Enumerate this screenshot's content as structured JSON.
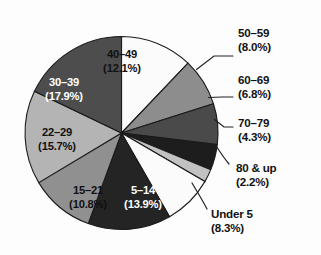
{
  "chart_data": {
    "type": "pie",
    "title": "",
    "subtitle": "",
    "xlabel": "",
    "ylabel": "",
    "legend_position": "none",
    "grid": false,
    "start_angle_deg": 0,
    "direction": "clockwise",
    "units": "percent",
    "categories": [
      "40–49",
      "50–59",
      "60–69",
      "70–79",
      "80 & up",
      "Under 5",
      "5–14",
      "15–21",
      "22–29",
      "30–39"
    ],
    "values": [
      12.1,
      8.0,
      6.8,
      4.3,
      2.2,
      8.3,
      13.9,
      10.8,
      15.7,
      17.9
    ],
    "slices": [
      {
        "category": "40–49",
        "value": 12.1,
        "label_name": "40–49",
        "label_pct": "(12.1%)",
        "color": "#fbfbfb",
        "label_placement": "inside",
        "text_color": "dark"
      },
      {
        "category": "50–59",
        "value": 8.0,
        "label_name": "50–59",
        "label_pct": "(8.0%)",
        "color": "#8d8d8d",
        "label_placement": "outside",
        "text_color": "dark"
      },
      {
        "category": "60–69",
        "value": 6.8,
        "label_name": "60–69",
        "label_pct": "(6.8%)",
        "color": "#4a4a4a",
        "label_placement": "outside",
        "text_color": "dark"
      },
      {
        "category": "70–79",
        "value": 4.3,
        "label_name": "70–79",
        "label_pct": "(4.3%)",
        "color": "#1d1d1d",
        "label_placement": "outside",
        "text_color": "dark"
      },
      {
        "category": "80 & up",
        "value": 2.2,
        "label_name": "80 & up",
        "label_pct": "(2.2%)",
        "color": "#c2c2c2",
        "label_placement": "outside",
        "text_color": "dark"
      },
      {
        "category": "Under 5",
        "value": 8.3,
        "label_name": "Under 5",
        "label_pct": "(8.3%)",
        "color": "#fbfbfb",
        "label_placement": "outside",
        "text_color": "dark"
      },
      {
        "category": "5–14",
        "value": 13.9,
        "label_name": "5–14",
        "label_pct": "(13.9%)",
        "color": "#242424",
        "label_placement": "inside",
        "text_color": "light"
      },
      {
        "category": "15–21",
        "value": 10.8,
        "label_name": "15–21",
        "label_pct": "(10.8%)",
        "color": "#909090",
        "label_placement": "inside",
        "text_color": "dark"
      },
      {
        "category": "22–29",
        "value": 15.7,
        "label_name": "22–29",
        "label_pct": "(15.7%)",
        "color": "#b4b4b4",
        "label_placement": "inside",
        "text_color": "dark"
      },
      {
        "category": "30–39",
        "value": 17.9,
        "label_name": "30–39",
        "label_pct": "(17.9%)",
        "color": "#4d4d4d",
        "label_placement": "inside",
        "text_color": "light"
      }
    ]
  },
  "geometry": {
    "cx": 121.5,
    "cy": 133,
    "r": 96.5
  },
  "inner_labels": [
    {
      "name": "40–49",
      "pct": "(12.1%)",
      "x": 122,
      "y": 58,
      "anchor": "middle",
      "tone": "dark"
    },
    {
      "name": "30–39",
      "pct": "(17.9%)",
      "x": 64,
      "y": 86,
      "anchor": "middle",
      "tone": "light"
    },
    {
      "name": "22–29",
      "pct": "(15.7%)",
      "x": 57,
      "y": 136,
      "anchor": "middle",
      "tone": "dark"
    },
    {
      "name": "15–21",
      "pct": "(10.8%)",
      "x": 88,
      "y": 194,
      "anchor": "middle",
      "tone": "dark"
    },
    {
      "name": "5–14",
      "pct": "(13.9%)",
      "x": 143,
      "y": 194,
      "anchor": "middle",
      "tone": "light"
    }
  ],
  "outer_labels": [
    {
      "name": "50–59",
      "pct": "(8.0%)",
      "x": 238,
      "y": 37,
      "anchor": "start"
    },
    {
      "name": "60–69",
      "pct": "(6.8%)",
      "x": 238,
      "y": 84,
      "anchor": "start"
    },
    {
      "name": "70–79",
      "pct": "(4.3%)",
      "x": 238,
      "y": 127,
      "anchor": "start"
    },
    {
      "name": "80 & up",
      "pct": "(2.2%)",
      "x": 236,
      "y": 172,
      "anchor": "start"
    },
    {
      "name": "Under 5",
      "pct": "(8.3%)",
      "x": 211,
      "y": 218,
      "anchor": "start"
    }
  ]
}
